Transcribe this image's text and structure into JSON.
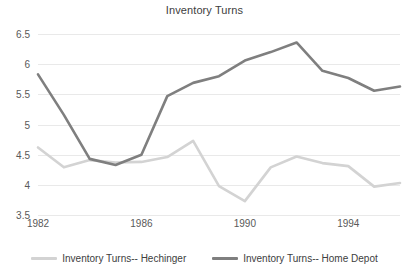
{
  "chart_data": {
    "type": "line",
    "title": "Inventory Turns",
    "xlabel": "",
    "ylabel": "",
    "grid": true,
    "legend_position": "bottom",
    "x": [
      1982,
      1983,
      1984,
      1985,
      1986,
      1987,
      1988,
      1989,
      1990,
      1991,
      1992,
      1993,
      1994,
      1995,
      1996
    ],
    "xlim": [
      1982,
      1996
    ],
    "ylim": [
      3.5,
      6.5
    ],
    "y_ticks": [
      "6.5",
      "6",
      "5.5",
      "5",
      "4.5",
      "4",
      "3.5"
    ],
    "y_tick_values": [
      6.5,
      6,
      5.5,
      5,
      4.5,
      4,
      3.5
    ],
    "x_ticks": [
      "1982",
      "1986",
      "1990",
      "1994"
    ],
    "x_tick_values": [
      1982,
      1986,
      1990,
      1994
    ],
    "series": [
      {
        "name": "Inventory Turns-- Hechinger",
        "color": "#d3d3d3",
        "values": [
          4.62,
          4.29,
          4.41,
          4.37,
          4.38,
          4.46,
          4.73,
          3.98,
          3.73,
          4.29,
          4.47,
          4.36,
          4.31,
          3.97,
          4.03
        ]
      },
      {
        "name": "Inventory Turns-- Home Depot",
        "color": "#7f7f7f",
        "values": [
          5.83,
          5.16,
          4.43,
          4.33,
          4.5,
          5.47,
          5.69,
          5.8,
          6.06,
          6.2,
          6.36,
          5.89,
          5.77,
          5.56,
          5.63
        ]
      }
    ]
  },
  "legend": {
    "items": [
      {
        "label": "Inventory Turns-- Hechinger"
      },
      {
        "label": "Inventory Turns-- Home Depot"
      }
    ]
  }
}
